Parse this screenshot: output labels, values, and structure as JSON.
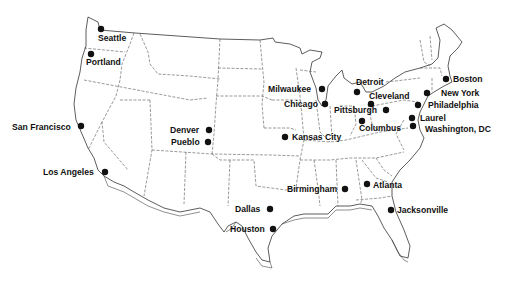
{
  "map": {
    "type": "US city locations map",
    "colors": {
      "background": "#ffffff",
      "ink": "#111111",
      "border": "#333333"
    }
  },
  "cities": [
    {
      "name": "Seattle",
      "dot": [
        101,
        29
      ],
      "label": [
        98,
        41
      ],
      "anchor": "start"
    },
    {
      "name": "Portland",
      "dot": [
        91,
        54
      ],
      "label": [
        86,
        65
      ],
      "anchor": "start"
    },
    {
      "name": "San Francisco",
      "dot": [
        81,
        126
      ],
      "label": [
        12,
        130
      ],
      "anchor": "start"
    },
    {
      "name": "Los Angeles",
      "dot": [
        105,
        172
      ],
      "label": [
        43,
        175
      ],
      "anchor": "start"
    },
    {
      "name": "Denver",
      "dot": [
        209,
        130
      ],
      "label": [
        170,
        133
      ],
      "anchor": "start"
    },
    {
      "name": "Pueblo",
      "dot": [
        208,
        142
      ],
      "label": [
        171,
        145
      ],
      "anchor": "start"
    },
    {
      "name": "Kansas City",
      "dot": [
        285,
        137
      ],
      "label": [
        292,
        140
      ],
      "anchor": "start"
    },
    {
      "name": "Milwaukee",
      "dot": [
        322,
        89
      ],
      "label": [
        268,
        92
      ],
      "anchor": "start"
    },
    {
      "name": "Chicago",
      "dot": [
        325,
        104
      ],
      "label": [
        284,
        107
      ],
      "anchor": "start"
    },
    {
      "name": "Detroit",
      "dot": [
        357,
        92
      ],
      "label": [
        356,
        85
      ],
      "anchor": "start"
    },
    {
      "name": "Cleveland",
      "dot": [
        371,
        104
      ],
      "label": [
        369,
        99
      ],
      "anchor": "start"
    },
    {
      "name": "Pittsburgh",
      "dot": [
        386,
        110
      ],
      "label": [
        334,
        113
      ],
      "anchor": "start"
    },
    {
      "name": "Columbus",
      "dot": [
        362,
        121
      ],
      "label": [
        359,
        131
      ],
      "anchor": "start"
    },
    {
      "name": "Boston",
      "dot": [
        446,
        79
      ],
      "label": [
        453,
        82
      ],
      "anchor": "start"
    },
    {
      "name": "New York",
      "dot": [
        427,
        93
      ],
      "label": [
        441,
        96
      ],
      "anchor": "start"
    },
    {
      "name": "Philadelphia",
      "dot": [
        418,
        105
      ],
      "label": [
        428,
        108
      ],
      "anchor": "start"
    },
    {
      "name": "Laurel",
      "dot": [
        412,
        118
      ],
      "label": [
        420,
        121
      ],
      "anchor": "start"
    },
    {
      "name": "Washington, DC",
      "dot": [
        413,
        126
      ],
      "label": [
        425,
        132
      ],
      "anchor": "start"
    },
    {
      "name": "Birmingham",
      "dot": [
        345,
        189
      ],
      "label": [
        287,
        192
      ],
      "anchor": "start"
    },
    {
      "name": "Atlanta",
      "dot": [
        367,
        184
      ],
      "label": [
        373,
        188
      ],
      "anchor": "start"
    },
    {
      "name": "Jacksonville",
      "dot": [
        391,
        210
      ],
      "label": [
        397,
        213
      ],
      "anchor": "start"
    },
    {
      "name": "Dallas",
      "dot": [
        270,
        209
      ],
      "label": [
        235,
        212
      ],
      "anchor": "start"
    },
    {
      "name": "Houston",
      "dot": [
        273,
        229
      ],
      "label": [
        230,
        232
      ],
      "anchor": "start"
    }
  ]
}
